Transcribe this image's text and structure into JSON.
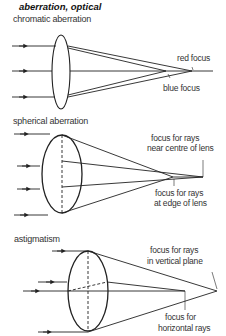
{
  "title": "aberration, optical",
  "sections": {
    "chromatic": {
      "heading": "chromatic aberration",
      "labels": {
        "red_focus": "red focus",
        "blue_focus": "blue focus"
      }
    },
    "spherical": {
      "heading": "spherical aberration",
      "labels": {
        "centre_focus_1": "focus for rays",
        "centre_focus_2": "near centre of lens",
        "edge_focus_1": "focus for rays",
        "edge_focus_2": "at edge of lens"
      }
    },
    "astigmatism": {
      "heading": "astigmatism",
      "labels": {
        "vertical_focus_1": "focus for rays",
        "vertical_focus_2": "in vertical plane",
        "horizontal_focus_1": "focus for",
        "horizontal_focus_2": "horizontal rays"
      }
    }
  },
  "colors": {
    "line": "#222222",
    "text": "#333333",
    "background": "#ffffff"
  }
}
